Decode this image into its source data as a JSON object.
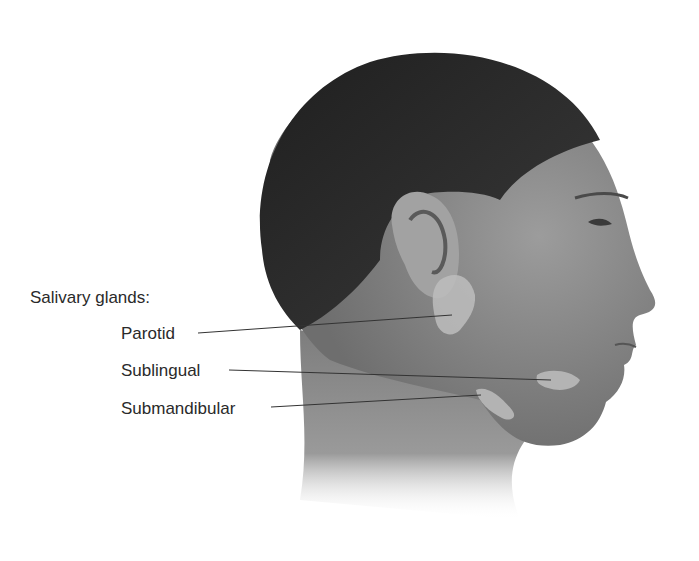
{
  "figure": {
    "heading": "Salivary glands:",
    "labels": [
      {
        "text": "Parotid",
        "x": 121,
        "y": 325,
        "line_start": [
          198,
          333
        ],
        "line_end": [
          452,
          315
        ]
      },
      {
        "text": "Sublingual",
        "x": 121,
        "y": 362,
        "line_start": [
          229,
          370
        ],
        "line_end": [
          551,
          380
        ]
      },
      {
        "text": "Submandibular",
        "x": 121,
        "y": 400,
        "line_start": [
          271,
          407
        ],
        "line_end": [
          481,
          395
        ]
      }
    ],
    "colors": {
      "background": "#ffffff",
      "hair": "#2b2b2b",
      "skin": "#8a8a8a",
      "gland": "#bdbdbd",
      "text": "#2a2a2a",
      "leader_line": "#333333"
    }
  }
}
